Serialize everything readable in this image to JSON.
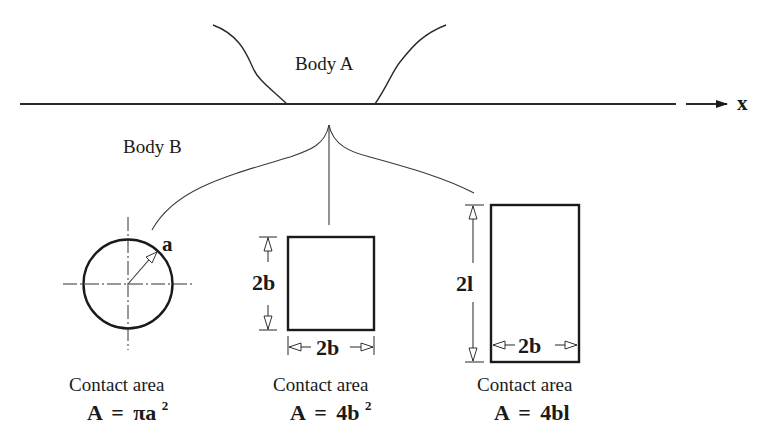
{
  "figure": {
    "axis_label": "x",
    "body_a_label": "Body A",
    "body_b_label": "Body B"
  },
  "shapes": [
    {
      "name": "circle",
      "dimension_labels": [
        "a"
      ],
      "caption": "Contact area",
      "formula": {
        "lhs": "A",
        "eq": "=",
        "rhs": "πa",
        "sup": "2"
      }
    },
    {
      "name": "square",
      "dimension_labels": [
        "2b",
        "2b"
      ],
      "caption": "Contact area",
      "formula": {
        "lhs": "A",
        "eq": "=",
        "rhs": "4b",
        "sup": "2"
      }
    },
    {
      "name": "rectangle",
      "dimension_labels": [
        "2l",
        "2b"
      ],
      "caption": "Contact area",
      "formula": {
        "lhs": "A",
        "eq": "=",
        "rhs": "4bl",
        "sup": ""
      }
    }
  ]
}
